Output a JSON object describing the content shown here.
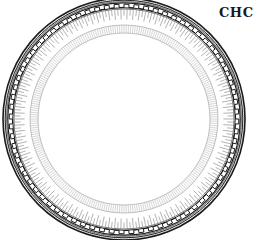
{
  "caption": {
    "text": "CHC"
  },
  "illustration": {
    "subject": "decorative plate engraving",
    "colors": {
      "ink": "#1a1a1a",
      "mid": "#555555",
      "light": "#9a9a9a",
      "paper": "#ffffff"
    },
    "center": [
      124,
      119
    ],
    "rings": {
      "outer_radius": 121,
      "band_inner_radius": 110,
      "fringe_inner_radius": 100,
      "inner_ring_radius": 94,
      "inner_ring_inner_radius": 86
    },
    "pattern_counts": {
      "greek_key_segments": 72,
      "fringe_ticks": 220,
      "inner_ticks": 260
    }
  }
}
